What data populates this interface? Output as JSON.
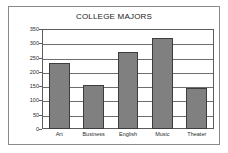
{
  "chart_data": {
    "type": "bar",
    "title": "COLLEGE MAJORS",
    "categories": [
      "Art",
      "Business",
      "English",
      "Music",
      "Theater"
    ],
    "values": [
      230,
      155,
      270,
      318,
      145
    ],
    "series": [
      {
        "name": "College Majors",
        "values": [
          230,
          155,
          270,
          318,
          145
        ]
      }
    ],
    "xlabel": "",
    "ylabel": "",
    "ylim": [
      0,
      350
    ],
    "ytick_step": 50,
    "yticks": [
      0,
      50,
      100,
      150,
      200,
      250,
      300,
      350
    ],
    "ytick_labels": [
      "0",
      "50",
      "100",
      "150",
      "200",
      "250",
      "300",
      "350"
    ],
    "grid": true,
    "grid_axis": "y",
    "legend": false,
    "legend_position": "none",
    "bar_color": "#808080",
    "bar_edge_color": "#3d3d3d",
    "plot_background": "#ffffff",
    "axis_color": "#5c5c5c",
    "gridline_color": "#6e6e6e",
    "frame_color": "#8a8a8a",
    "text_color": "#2a2a2a",
    "title_color": "#1a1a1a"
  }
}
